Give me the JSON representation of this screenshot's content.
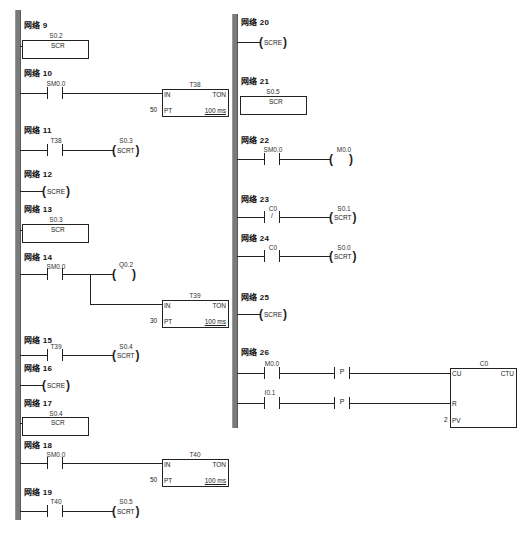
{
  "diagram": {
    "type": "ladder-logic",
    "network_label_prefix": "网络"
  },
  "left_column": {
    "networks": [
      {
        "id": "9",
        "title": "网络 9",
        "elements": [
          {
            "kind": "SCR",
            "operand": "S0.2",
            "label": "SCR"
          }
        ]
      },
      {
        "id": "10",
        "title": "网络 10",
        "elements": [
          {
            "kind": "contact_no",
            "operand": "SM0.0"
          },
          {
            "kind": "timer",
            "name": "T38",
            "type": "TON",
            "in": "IN",
            "pt_label": "PT",
            "pt_value": "50",
            "base": "100 ms"
          }
        ]
      },
      {
        "id": "11",
        "title": "网络 11",
        "elements": [
          {
            "kind": "contact_no",
            "operand": "T38"
          },
          {
            "kind": "coil",
            "operand": "S0.3",
            "label": "SCRT"
          }
        ]
      },
      {
        "id": "12",
        "title": "网络 12",
        "elements": [
          {
            "kind": "coil",
            "label": "SCRE"
          }
        ]
      },
      {
        "id": "13",
        "title": "网络 13",
        "elements": [
          {
            "kind": "SCR",
            "operand": "S0.3",
            "label": "SCR"
          }
        ]
      },
      {
        "id": "14",
        "title": "网络 14",
        "elements": [
          {
            "kind": "contact_no",
            "operand": "SM0.0"
          },
          {
            "kind": "coil",
            "operand": "Q0.2",
            "label": ""
          },
          {
            "kind": "timer",
            "name": "T39",
            "type": "TON",
            "in": "IN",
            "pt_label": "PT",
            "pt_value": "30",
            "base": "100 ms"
          }
        ]
      },
      {
        "id": "15",
        "title": "网络 15",
        "elements": [
          {
            "kind": "contact_no",
            "operand": "T39"
          },
          {
            "kind": "coil",
            "operand": "S0.4",
            "label": "SCRT"
          }
        ]
      },
      {
        "id": "16",
        "title": "网络 16",
        "elements": [
          {
            "kind": "coil",
            "label": "SCRE"
          }
        ]
      },
      {
        "id": "17",
        "title": "网络 17",
        "elements": [
          {
            "kind": "SCR",
            "operand": "S0.4",
            "label": "SCR"
          }
        ]
      },
      {
        "id": "18",
        "title": "网络 18",
        "elements": [
          {
            "kind": "contact_no",
            "operand": "SM0.0"
          },
          {
            "kind": "timer",
            "name": "T40",
            "type": "TON",
            "in": "IN",
            "pt_label": "PT",
            "pt_value": "50",
            "base": "100 ms"
          }
        ]
      },
      {
        "id": "19",
        "title": "网络 19",
        "elements": [
          {
            "kind": "contact_no",
            "operand": "T40"
          },
          {
            "kind": "coil",
            "operand": "S0.5",
            "label": "SCRT"
          }
        ]
      }
    ]
  },
  "right_column": {
    "networks": [
      {
        "id": "20",
        "title": "网络 20",
        "elements": [
          {
            "kind": "coil",
            "label": "SCRE"
          }
        ]
      },
      {
        "id": "21",
        "title": "网络 21",
        "elements": [
          {
            "kind": "SCR",
            "operand": "S0.5",
            "label": "SCR"
          }
        ]
      },
      {
        "id": "22",
        "title": "网络 22",
        "elements": [
          {
            "kind": "contact_no",
            "operand": "SM0.0"
          },
          {
            "kind": "coil",
            "operand": "M0.0",
            "label": ""
          }
        ]
      },
      {
        "id": "23",
        "title": "网络 23",
        "elements": [
          {
            "kind": "contact_nc",
            "operand": "C0",
            "mark": "/"
          },
          {
            "kind": "coil",
            "operand": "S0.1",
            "label": "SCRT"
          }
        ]
      },
      {
        "id": "24",
        "title": "网络 24",
        "elements": [
          {
            "kind": "contact_no",
            "operand": "C0"
          },
          {
            "kind": "coil",
            "operand": "S0.0",
            "label": "SCRT"
          }
        ]
      },
      {
        "id": "25",
        "title": "网络 25",
        "elements": [
          {
            "kind": "coil",
            "label": "SCRE"
          }
        ]
      },
      {
        "id": "26",
        "title": "网络 26",
        "elements": [
          {
            "kind": "contact_no",
            "operand": "M0.0"
          },
          {
            "kind": "edge_p",
            "mark": "P"
          },
          {
            "kind": "contact_no",
            "operand": "I0.1"
          },
          {
            "kind": "edge_p",
            "mark": "P"
          },
          {
            "kind": "counter",
            "name": "C0",
            "type": "CTU",
            "cu": "CU",
            "r": "R",
            "pv_label": "PV",
            "pv_value": "2"
          }
        ]
      }
    ]
  }
}
